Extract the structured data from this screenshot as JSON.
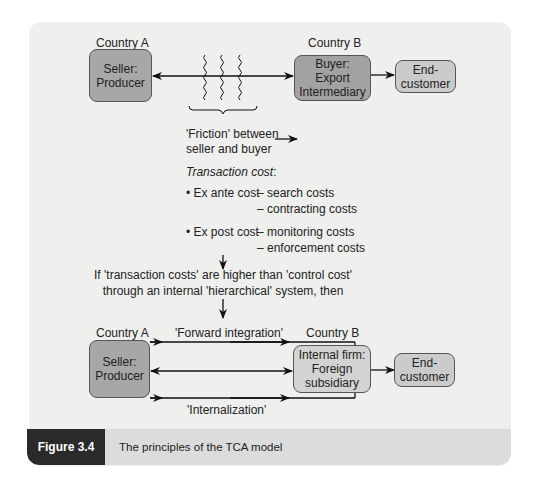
{
  "figure": {
    "label": "Figure 3.4",
    "caption": "The principles of the TCA model"
  },
  "top_diagram": {
    "country_a": "Country A",
    "country_b": "Country B",
    "seller_line1": "Seller:",
    "seller_line2": "Producer",
    "buyer_line1": "Buyer:",
    "buyer_line2": "Export",
    "buyer_line3": "Intermediary",
    "end_customer_line1": "End-",
    "end_customer_line2": "customer"
  },
  "friction": {
    "line1": "'Friction' between",
    "line2": "seller and buyer"
  },
  "transaction_cost": {
    "heading": "Transaction cost",
    "heading_suffix": ":",
    "ex_ante": {
      "label": "• Ex ante cost",
      "items": [
        "– search costs",
        "– contracting costs"
      ]
    },
    "ex_post": {
      "label": "• Ex post cost",
      "items": [
        "– monitoring costs",
        "– enforcement costs"
      ]
    }
  },
  "condition": {
    "line1": "If 'transaction costs' are higher than 'control cost'",
    "line2": "through an internal 'hierarchical' system, then"
  },
  "bottom_diagram": {
    "country_a": "Country A",
    "country_b": "Country B",
    "forward_integration": "'Forward integration'",
    "internalization": "'Internalization'",
    "seller_line1": "Seller:",
    "seller_line2": "Producer",
    "internal_line1": "Internal firm:",
    "internal_line2": "Foreign",
    "internal_line3": "subsidiary",
    "end_customer_line1": "End-",
    "end_customer_line2": "customer"
  },
  "colors": {
    "panel": "#efefee",
    "seller_box": "#a7a7a7",
    "buyer_box": "#a2a2a2",
    "end_customer_box": "#cbcbcb",
    "internal_box": "#d3d3d3",
    "caption_label_bg": "#2a2a2a",
    "caption_bar_bg": "#dcdcdc"
  }
}
